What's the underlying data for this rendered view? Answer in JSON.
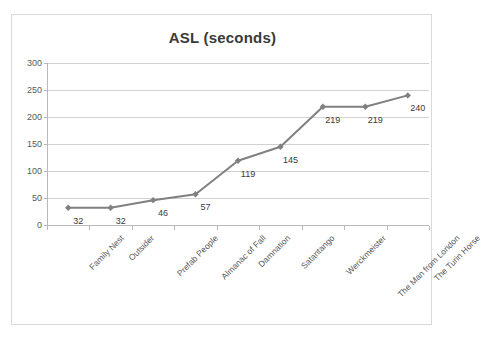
{
  "chart_data": {
    "type": "line",
    "title": "ASL (seconds)",
    "xlabel": "",
    "ylabel": "",
    "ylim": [
      0,
      300
    ],
    "yticks": [
      0,
      50,
      100,
      150,
      200,
      250,
      300
    ],
    "grid": true,
    "legend": "none",
    "series_color": "#808080",
    "categories": [
      "Family Nest",
      "Outsider",
      "Prefab People",
      "Almanac of Fall",
      "Damnation",
      "Satantango",
      "Werckmeister",
      "The Man from London",
      "The Turin Horse"
    ],
    "values": [
      32,
      32,
      46,
      57,
      119,
      145,
      219,
      219,
      240
    ],
    "data_labels": [
      "32",
      "32",
      "46",
      "57",
      "119",
      "145",
      "219",
      "219",
      "240"
    ]
  },
  "colors": {
    "series": "#808080",
    "gridline": "#d0d0d0",
    "axis": "#b8b8b8",
    "border": "#d9d9d9",
    "text": "#595959",
    "title_text": "#3a3a3a",
    "background": "#ffffff"
  }
}
